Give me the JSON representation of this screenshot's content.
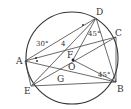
{
  "diagram": {
    "type": "geometry",
    "circle": {
      "center": "O"
    },
    "points": {
      "A": {
        "label": "A"
      },
      "B": {
        "label": "B"
      },
      "C": {
        "label": "C"
      },
      "D": {
        "label": "D"
      },
      "E": {
        "label": "E"
      },
      "F": {
        "label": "F"
      },
      "G": {
        "label": "G"
      },
      "O": {
        "label": "O"
      }
    },
    "annotations": {
      "angle_A": "30°",
      "length_AF": "4",
      "angle_D": "45°",
      "angle_B": "45°"
    }
  }
}
